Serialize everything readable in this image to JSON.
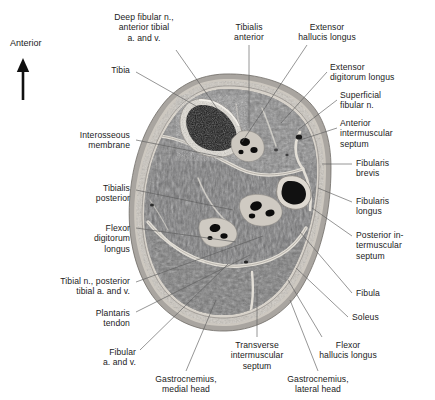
{
  "figure": {
    "orientation_marker": {
      "label": "Anterior",
      "icon": "up-arrow-icon",
      "x": 10,
      "y": 40
    },
    "section_title": "",
    "image_kind": "anatomical cross-section, right leg, mid-calf (transverse MRI-like section)"
  },
  "labels": [
    {
      "id": "deep-fibular-n",
      "text": "Deep fibular n.,\nanterior tibial\na. and v.",
      "side": "c",
      "x": 102,
      "y": 12,
      "w": 84,
      "leader": [
        [
          176,
          50
        ],
        [
          228,
          124
        ]
      ]
    },
    {
      "id": "tibialis-anterior",
      "text": "Tibialis\nanterior",
      "side": "c",
      "x": 222,
      "y": 22,
      "w": 54,
      "leader": [
        [
          249,
          45
        ],
        [
          249,
          128
        ]
      ]
    },
    {
      "id": "extensor-hallucis-longus",
      "text": "Extensor\nhallucis longus",
      "side": "c",
      "x": 286,
      "y": 22,
      "w": 82,
      "leader": [
        [
          307,
          45
        ],
        [
          242,
          142
        ]
      ]
    },
    {
      "id": "tibia",
      "text": "Tibia",
      "side": "l",
      "x": 60,
      "y": 65,
      "w": 70,
      "leader": [
        [
          136,
          72
        ],
        [
          196,
          106
        ]
      ]
    },
    {
      "id": "extensor-digitorum-longus",
      "text": "Extensor\ndigitorum longus",
      "side": "r",
      "x": 330,
      "y": 62,
      "w": 100,
      "leader": [
        [
          327,
          72
        ],
        [
          281,
          123
        ]
      ]
    },
    {
      "id": "superficial-fibular-n",
      "text": "Superficial\nfibular n.",
      "side": "r",
      "x": 340,
      "y": 90,
      "w": 80,
      "leader": [
        [
          337,
          100
        ],
        [
          298,
          130
        ]
      ]
    },
    {
      "id": "interosseous-membrane",
      "text": "Interosseous\nmembrane",
      "side": "l",
      "x": 26,
      "y": 130,
      "w": 104,
      "leader": [
        [
          136,
          140
        ],
        [
          222,
          157
        ]
      ]
    },
    {
      "id": "anterior-intermuscular-septum",
      "text": "Anterior\nintermuscular\nseptum",
      "side": "r",
      "x": 340,
      "y": 118,
      "w": 90,
      "leader": [
        [
          337,
          128
        ],
        [
          300,
          140
        ]
      ]
    },
    {
      "id": "fibularis-brevis",
      "text": "Fibularis\nbrevis",
      "side": "r",
      "x": 356,
      "y": 158,
      "w": 72,
      "leader": [
        [
          352,
          164
        ],
        [
          322,
          164
        ]
      ]
    },
    {
      "id": "tibialis-posterior",
      "text": "Tibialis\nposterior",
      "side": "l",
      "x": 44,
      "y": 183,
      "w": 86,
      "leader": [
        [
          136,
          190
        ],
        [
          233,
          210
        ]
      ]
    },
    {
      "id": "fibularis-longus",
      "text": "Fibularis\nlongus",
      "side": "r",
      "x": 356,
      "y": 196,
      "w": 72,
      "leader": [
        [
          352,
          202
        ],
        [
          318,
          188
        ]
      ]
    },
    {
      "id": "flexor-digitorum-longus",
      "text": "Flexor\ndigitorum\nlongus",
      "side": "l",
      "x": 44,
      "y": 223,
      "w": 86,
      "leader": [
        [
          136,
          228
        ],
        [
          236,
          242
        ]
      ]
    },
    {
      "id": "posterior-intermuscular-septum",
      "text": "Posterior in-\ntermuscular\nseptum",
      "side": "r",
      "x": 356,
      "y": 230,
      "w": 78,
      "leader": [
        [
          352,
          236
        ],
        [
          312,
          208
        ]
      ]
    },
    {
      "id": "tibial-n-posterior-tibial",
      "text": "Tibial n., posterior\ntibial a. and v.",
      "side": "l",
      "x": 16,
      "y": 276,
      "w": 114,
      "leader": [
        [
          136,
          282
        ],
        [
          263,
          236
        ]
      ]
    },
    {
      "id": "fibula",
      "text": "Fibula",
      "side": "r",
      "x": 356,
      "y": 288,
      "w": 60,
      "leader": [
        [
          352,
          293
        ],
        [
          300,
          232
        ]
      ]
    },
    {
      "id": "plantaris-tendon",
      "text": "Plantaris\ntendon",
      "side": "l",
      "x": 52,
      "y": 308,
      "w": 78,
      "leader": [
        [
          136,
          312
        ],
        [
          250,
          255
        ]
      ]
    },
    {
      "id": "soleus",
      "text": "Soleus",
      "side": "r",
      "x": 352,
      "y": 312,
      "w": 60,
      "leader": [
        [
          348,
          317
        ],
        [
          296,
          268
        ]
      ]
    },
    {
      "id": "fibular-a-and-v",
      "text": "Fibular\na. and v.",
      "side": "l",
      "x": 66,
      "y": 347,
      "w": 70,
      "leader": [
        [
          140,
          350
        ],
        [
          228,
          264
        ]
      ]
    },
    {
      "id": "gastrocnemius-medial-head",
      "text": "Gastrocnemius,\nmedial head",
      "side": "c",
      "x": 140,
      "y": 374,
      "w": 92,
      "leader": [
        [
          186,
          371
        ],
        [
          216,
          300
        ]
      ]
    },
    {
      "id": "transverse-intermuscular-septum",
      "text": "Transverse\nintermuscular\nseptum",
      "side": "c",
      "x": 216,
      "y": 340,
      "w": 82,
      "leader": [
        [
          257,
          337
        ],
        [
          257,
          286
        ]
      ]
    },
    {
      "id": "flexor-hallucis-longus",
      "text": "Flexor\nhallucis longus",
      "side": "c",
      "x": 305,
      "y": 340,
      "w": 86,
      "leader": [
        [
          322,
          337
        ],
        [
          288,
          280
        ]
      ]
    },
    {
      "id": "gastrocnemius-lateral-head",
      "text": "Gastrocnemius,\nlateral head",
      "side": "c",
      "x": 272,
      "y": 374,
      "w": 92,
      "leader": [
        [
          318,
          371
        ],
        [
          290,
          300
        ]
      ]
    }
  ],
  "colors": {
    "leader_line": "#5d5d5d",
    "text": "#1b1b1b",
    "background": "#ffffff",
    "skin_outer": "#b4b0aa",
    "subcutaneous_fat": "#cfcac2",
    "muscle_mid": "#6f6f70",
    "muscle_dark": "#4f4f51",
    "fascia_light": "#dedad3",
    "bone_cortex": "#ddd9d1",
    "bone_marrow": "#161616",
    "vessel_dark": "#0d0d0d"
  }
}
